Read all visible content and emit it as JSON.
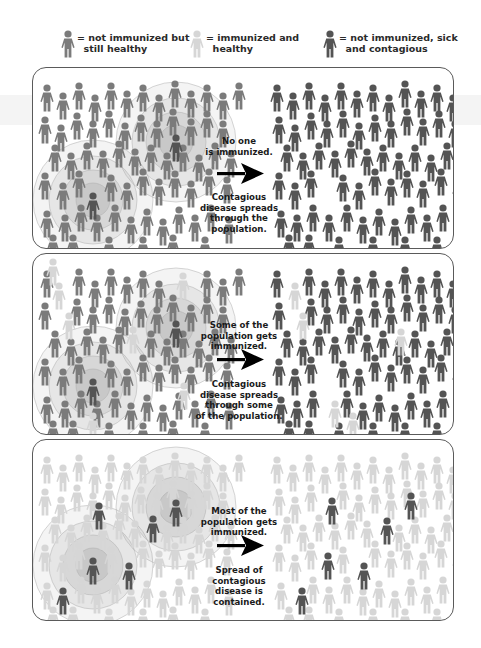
{
  "colors": {
    "not_immunized_healthy": "#7b7b7b",
    "immunized_healthy": "#d6d6d6",
    "sick_contagious": "#545454",
    "arrow": "#000000",
    "panel_border": "#5a5a5a",
    "ring": "#9a9a9a"
  },
  "legend": [
    {
      "status": "not_immunized_healthy",
      "icon": "person-icon",
      "text": "= not immunized but\n  still healthy"
    },
    {
      "status": "immunized_healthy",
      "icon": "person-icon",
      "text": "= immunized and\n  healthy"
    },
    {
      "status": "sick_contagious",
      "icon": "person-icon",
      "text": "= not immunized, sick\n  and contagious"
    }
  ],
  "panels": [
    {
      "id": "no-immunization",
      "caption_top": "No one\nis immunized.",
      "caption_bottom": "Contagious\ndisease spreads\nthrough the\npopulation.",
      "outbreaks": [
        {
          "cx": 60,
          "cy": 128
        },
        {
          "cx": 143,
          "cy": 70
        }
      ],
      "left_default": "not_immunized_healthy",
      "right_default": "sick_contagious",
      "left_immunized": [],
      "right_immunized": [],
      "left_sick": [
        [
          143,
          70
        ],
        [
          60,
          128
        ]
      ],
      "right_sick": []
    },
    {
      "id": "some-immunization",
      "caption_top": "Some of the\npopulation gets\nimmunized.",
      "caption_bottom": "Contagious\ndisease spreads\nthrough some\nof the population.",
      "outbreaks": [
        {
          "cx": 60,
          "cy": 128
        },
        {
          "cx": 143,
          "cy": 70
        }
      ],
      "left_default": "not_immunized_healthy",
      "right_default": "sick_contagious",
      "left_immunized": [
        [
          26,
          32
        ],
        [
          36,
          62
        ],
        [
          100,
          76
        ],
        [
          150,
          22
        ],
        [
          151,
          132
        ],
        [
          60,
          162
        ],
        [
          20,
          8
        ]
      ],
      "right_immunized": [
        [
          262,
          32
        ],
        [
          270,
          62
        ],
        [
          368,
          78
        ],
        [
          431,
          40
        ],
        [
          442,
          128
        ],
        [
          320,
          162
        ],
        [
          302,
          150
        ]
      ],
      "left_sick": [
        [
          143,
          70
        ],
        [
          60,
          128
        ]
      ],
      "right_sick": []
    },
    {
      "id": "most-immunization",
      "caption_top": "Most of the\npopulation gets\nimmunized.",
      "caption_bottom": "Spread of\ncontagious\ndisease is\ncontained.",
      "outbreaks": [
        {
          "cx": 60,
          "cy": 121
        },
        {
          "cx": 143,
          "cy": 63
        }
      ],
      "left_default": "immunized_healthy",
      "right_default": "immunized_healthy",
      "left_immunized": [],
      "right_immunized": [],
      "left_sick": [
        [
          66,
          66
        ],
        [
          120,
          79
        ],
        [
          60,
          121
        ],
        [
          96,
          126
        ],
        [
          30,
          151
        ],
        [
          143,
          63
        ]
      ],
      "right_sick": [
        [
          299,
          61
        ],
        [
          378,
          56
        ],
        [
          354,
          81
        ],
        [
          295,
          116
        ],
        [
          331,
          126
        ],
        [
          269,
          151
        ]
      ]
    }
  ],
  "crowd": {
    "left": [
      [
        14,
        20
      ],
      [
        30,
        28
      ],
      [
        46,
        18
      ],
      [
        62,
        30
      ],
      [
        78,
        18
      ],
      [
        94,
        26
      ],
      [
        110,
        20
      ],
      [
        126,
        30
      ],
      [
        142,
        16
      ],
      [
        158,
        26
      ],
      [
        174,
        20
      ],
      [
        190,
        28
      ],
      [
        206,
        18
      ],
      [
        12,
        52
      ],
      [
        28,
        60
      ],
      [
        44,
        48
      ],
      [
        60,
        56
      ],
      [
        76,
        46
      ],
      [
        92,
        58
      ],
      [
        108,
        50
      ],
      [
        124,
        56
      ],
      [
        140,
        44
      ],
      [
        158,
        54
      ],
      [
        174,
        46
      ],
      [
        190,
        56
      ],
      [
        22,
        80
      ],
      [
        38,
        88
      ],
      [
        54,
        78
      ],
      [
        70,
        86
      ],
      [
        86,
        76
      ],
      [
        102,
        84
      ],
      [
        118,
        80
      ],
      [
        134,
        88
      ],
      [
        150,
        80
      ],
      [
        166,
        90
      ],
      [
        182,
        78
      ],
      [
        198,
        86
      ],
      [
        12,
        108
      ],
      [
        30,
        118
      ],
      [
        46,
        106
      ],
      [
        78,
        110
      ],
      [
        94,
        118
      ],
      [
        110,
        104
      ],
      [
        126,
        114
      ],
      [
        142,
        106
      ],
      [
        158,
        116
      ],
      [
        176,
        104
      ],
      [
        194,
        112
      ],
      [
        14,
        146
      ],
      [
        32,
        150
      ],
      [
        48,
        140
      ],
      [
        64,
        150
      ],
      [
        82,
        140
      ],
      [
        98,
        152
      ],
      [
        114,
        144
      ],
      [
        130,
        154
      ],
      [
        146,
        142
      ],
      [
        162,
        150
      ],
      [
        178,
        140
      ],
      [
        196,
        152
      ],
      [
        20,
        170
      ],
      [
        40,
        170
      ],
      [
        76,
        172
      ],
      [
        110,
        172
      ],
      [
        140,
        170
      ],
      [
        172,
        172
      ]
    ],
    "right": [
      [
        244,
        20
      ],
      [
        260,
        28
      ],
      [
        276,
        18
      ],
      [
        292,
        30
      ],
      [
        308,
        18
      ],
      [
        324,
        26
      ],
      [
        340,
        20
      ],
      [
        356,
        30
      ],
      [
        372,
        16
      ],
      [
        388,
        26
      ],
      [
        404,
        20
      ],
      [
        420,
        30
      ],
      [
        436,
        18
      ],
      [
        246,
        52
      ],
      [
        262,
        60
      ],
      [
        278,
        48
      ],
      [
        294,
        56
      ],
      [
        310,
        46
      ],
      [
        326,
        58
      ],
      [
        342,
        50
      ],
      [
        358,
        56
      ],
      [
        374,
        44
      ],
      [
        390,
        54
      ],
      [
        406,
        46
      ],
      [
        422,
        56
      ],
      [
        254,
        80
      ],
      [
        270,
        88
      ],
      [
        286,
        78
      ],
      [
        302,
        86
      ],
      [
        318,
        76
      ],
      [
        334,
        84
      ],
      [
        350,
        80
      ],
      [
        366,
        88
      ],
      [
        382,
        80
      ],
      [
        398,
        90
      ],
      [
        414,
        78
      ],
      [
        430,
        86
      ],
      [
        246,
        108
      ],
      [
        262,
        118
      ],
      [
        278,
        106
      ],
      [
        310,
        110
      ],
      [
        326,
        118
      ],
      [
        342,
        104
      ],
      [
        358,
        114
      ],
      [
        374,
        106
      ],
      [
        390,
        116
      ],
      [
        408,
        104
      ],
      [
        426,
        112
      ],
      [
        248,
        146
      ],
      [
        264,
        150
      ],
      [
        280,
        140
      ],
      [
        296,
        150
      ],
      [
        314,
        140
      ],
      [
        330,
        152
      ],
      [
        346,
        144
      ],
      [
        362,
        154
      ],
      [
        378,
        142
      ],
      [
        394,
        150
      ],
      [
        410,
        140
      ],
      [
        428,
        152
      ],
      [
        256,
        170
      ],
      [
        276,
        170
      ],
      [
        306,
        172
      ],
      [
        340,
        172
      ],
      [
        372,
        172
      ],
      [
        404,
        172
      ]
    ]
  }
}
